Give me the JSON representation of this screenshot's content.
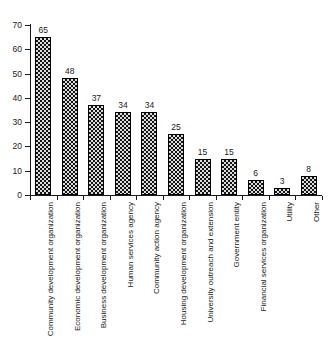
{
  "chart_data": {
    "type": "bar",
    "title": "",
    "subtitle": "",
    "xlabel": "",
    "ylabel": "",
    "ylim": [
      0,
      70
    ],
    "yticks": [
      0,
      10,
      20,
      30,
      40,
      50,
      60,
      70
    ],
    "grid": false,
    "legend": null,
    "orientation": "vertical",
    "bar_color": "#141414",
    "bar_pattern": "dotted-texture",
    "value_labels_shown": true,
    "categories": [
      "Community development organization",
      "Economic development organization",
      "Business development organization",
      "Human services agency",
      "Community action agency",
      "Housing development organization",
      "University outreach and extension",
      "Government entity",
      "Financial services organization",
      "Utility",
      "Other"
    ],
    "values": [
      65,
      48,
      37,
      34,
      34,
      25,
      15,
      15,
      6,
      3,
      8
    ]
  }
}
